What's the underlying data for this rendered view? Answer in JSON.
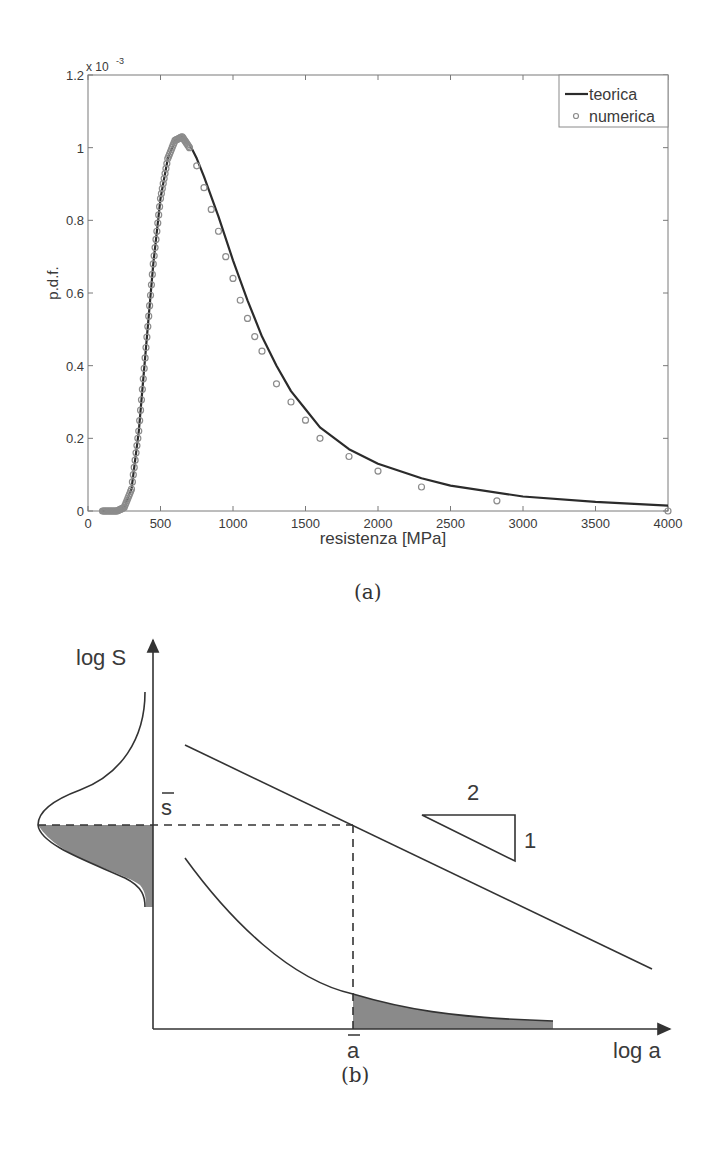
{
  "figure_a": {
    "caption": "(a)",
    "exponent_label": "x 10",
    "exponent_power": "-3"
  },
  "figure_b": {
    "caption": "(b)",
    "y_axis_label": "log S",
    "x_axis_label": "log a",
    "s_bar_label": "s",
    "a_bar_label": "a",
    "slope_run_label": "2",
    "slope_rise_label": "1",
    "colors": {
      "line": "#333333",
      "shade": "#8a8a8a"
    }
  },
  "chart_data": [
    {
      "type": "line",
      "title": "",
      "xlabel": "resistenza [MPa]",
      "ylabel": "p.d.f.",
      "y_scale_factor": "x 10^-3",
      "xlim": [
        0,
        4000
      ],
      "ylim": [
        0,
        0.0012
      ],
      "grid": false,
      "legend_position": "upper right",
      "x_ticks": [
        "0",
        "500",
        "1000",
        "1500",
        "2000",
        "2500",
        "3000",
        "3500",
        "4000"
      ],
      "y_ticks": [
        "0",
        "0.2",
        "0.4",
        "0.6",
        "0.8",
        "1",
        "1.2"
      ],
      "series": [
        {
          "name": "teorica",
          "style": "solid line",
          "color": "#2b2b2b",
          "x": [
            100,
            200,
            250,
            300,
            350,
            400,
            450,
            500,
            550,
            600,
            650,
            700,
            750,
            800,
            900,
            1000,
            1100,
            1200,
            1300,
            1400,
            1500,
            1600,
            1800,
            2000,
            2300,
            2500,
            3000,
            3500,
            4000
          ],
          "y": [
            0.0,
            0.0,
            1e-05,
            6e-05,
            0.00022,
            0.00045,
            0.00068,
            0.00086,
            0.00097,
            0.00102,
            0.00103,
            0.00101,
            0.00097,
            0.00092,
            0.00081,
            0.00069,
            0.00058,
            0.00048,
            0.0004,
            0.00033,
            0.00028,
            0.00023,
            0.00017,
            0.00013,
            9e-05,
            7e-05,
            4e-05,
            2.5e-05,
            1.5e-05
          ]
        },
        {
          "name": "numerica",
          "style": "circle markers",
          "color": "#8c8c8c",
          "x": [
            100,
            200,
            250,
            300,
            350,
            400,
            450,
            500,
            550,
            600,
            650,
            700,
            750,
            800,
            850,
            900,
            950,
            1000,
            1050,
            1100,
            1150,
            1200,
            1300,
            1400,
            1500,
            1600,
            1800,
            2000,
            2300,
            2820,
            4000
          ],
          "y": [
            0.0,
            0.0,
            1e-05,
            6e-05,
            0.00022,
            0.00045,
            0.00068,
            0.00086,
            0.00097,
            0.00102,
            0.00103,
            0.001,
            0.00095,
            0.00089,
            0.00083,
            0.00077,
            0.0007,
            0.00064,
            0.00058,
            0.00053,
            0.00048,
            0.00044,
            0.00035,
            0.0003,
            0.00025,
            0.0002,
            0.00015,
            0.00011,
            6.6e-05,
            2.8e-05,
            0.0
          ]
        }
      ]
    }
  ]
}
